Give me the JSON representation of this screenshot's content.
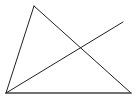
{
  "diagram": {
    "type": "geometry",
    "stroke_color": "#222222",
    "background": "#ffffff",
    "points": {
      "top": [
        34,
        6
      ],
      "bottom_left": [
        6,
        93
      ],
      "bottom_right": [
        131,
        93
      ],
      "line_end": [
        123,
        22
      ],
      "intersection": [
        80,
        49
      ]
    },
    "segments": [
      {
        "name": "left-side",
        "from": "bottom_left",
        "to": "top"
      },
      {
        "name": "right-side",
        "from": "top",
        "to": "bottom_right"
      },
      {
        "name": "base",
        "from": "bottom_left",
        "to": "bottom_right"
      },
      {
        "name": "cevian-line",
        "from": "bottom_left",
        "to": "line_end"
      }
    ]
  }
}
